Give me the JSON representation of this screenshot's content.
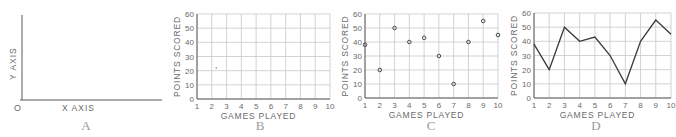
{
  "panels": [
    {
      "id": "A",
      "caption": "A",
      "type": "axes",
      "x_label": "X AXIS",
      "y_label": "Y AXIS",
      "origin_label": "O"
    },
    {
      "id": "B",
      "caption": "B",
      "type": "grid",
      "x_label": "GAMES  PLAYED",
      "y_label": "POINTS SCORED"
    },
    {
      "id": "C",
      "caption": "C",
      "type": "scatter",
      "x_label": "GAMES  PLAYED",
      "y_label": "POINTS SCORED"
    },
    {
      "id": "D",
      "caption": "D",
      "type": "line",
      "x_label": "GAMES  PLAYED",
      "y_label": "POINTS SCORED"
    }
  ],
  "chart_data": [
    {
      "panel": "A",
      "type": "line",
      "title": "",
      "xlabel": "X AXIS",
      "ylabel": "Y AXIS",
      "annotations": [
        "O"
      ],
      "grid": false,
      "x": [],
      "values": []
    },
    {
      "panel": "B",
      "type": "scatter",
      "title": "",
      "xlabel": "GAMES  PLAYED",
      "ylabel": "POINTS SCORED",
      "x_ticks": [
        1,
        2,
        3,
        4,
        5,
        6,
        7,
        8,
        9,
        10
      ],
      "y_ticks": [
        0,
        10,
        20,
        30,
        40,
        50,
        60
      ],
      "xlim": [
        1,
        10
      ],
      "ylim": [
        0,
        60
      ],
      "grid": true,
      "x": [
        2.3
      ],
      "values": [
        22
      ]
    },
    {
      "panel": "C",
      "type": "scatter",
      "title": "",
      "xlabel": "GAMES  PLAYED",
      "ylabel": "POINTS SCORED",
      "x_ticks": [
        1,
        2,
        3,
        4,
        5,
        6,
        7,
        8,
        9,
        10
      ],
      "y_ticks": [
        0,
        10,
        20,
        30,
        40,
        50,
        60
      ],
      "xlim": [
        1,
        10
      ],
      "ylim": [
        0,
        60
      ],
      "grid": true,
      "x": [
        1,
        2,
        3,
        4,
        5,
        6,
        7,
        8,
        9,
        10
      ],
      "values": [
        38,
        20,
        50,
        40,
        43,
        30,
        10,
        40,
        55,
        45
      ]
    },
    {
      "panel": "D",
      "type": "line",
      "title": "",
      "xlabel": "GAMES  PLAYED",
      "ylabel": "POINTS SCORED",
      "x_ticks": [
        1,
        2,
        3,
        4,
        5,
        6,
        7,
        8,
        9,
        10
      ],
      "y_ticks": [
        0,
        10,
        20,
        30,
        40,
        50,
        60
      ],
      "xlim": [
        1,
        10
      ],
      "ylim": [
        0,
        60
      ],
      "grid": true,
      "x": [
        1,
        2,
        3,
        4,
        5,
        6,
        7,
        8,
        9,
        10
      ],
      "values": [
        38,
        20,
        50,
        40,
        43,
        30,
        10,
        40,
        55,
        45
      ]
    }
  ],
  "colors": {
    "axis": "#5a5a5a",
    "grid": "#c8c8c8",
    "text": "#6a6a6a",
    "caption": "#9a9a9a",
    "line": "#3a3a3a"
  }
}
